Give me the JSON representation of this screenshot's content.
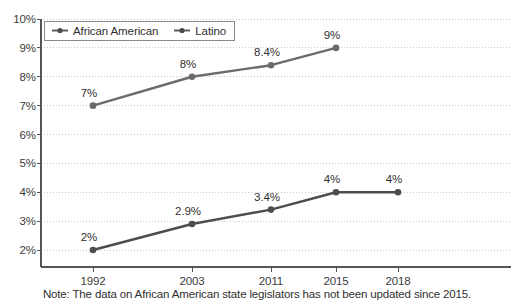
{
  "chart_data": {
    "type": "line",
    "title": "",
    "xlabel": "",
    "ylabel": "",
    "categories": [
      "1992",
      "2003",
      "2011",
      "2015",
      "2018"
    ],
    "ylim": [
      2,
      10
    ],
    "ytick_labels": [
      "2%",
      "3%",
      "4%",
      "5%",
      "6%",
      "7%",
      "8%",
      "9%",
      "10%"
    ],
    "ytick_values": [
      2,
      3,
      4,
      5,
      6,
      7,
      8,
      9,
      10
    ],
    "grid": true,
    "legend_position": "top-left",
    "series": [
      {
        "name": "African American",
        "color": "#6b6b6b",
        "values": [
          7,
          8,
          8.4,
          9,
          null
        ],
        "labels": [
          "7%",
          "8%",
          "8.4%",
          "9%",
          ""
        ]
      },
      {
        "name": "Latino",
        "color": "#4d4d4d",
        "values": [
          2,
          2.9,
          3.4,
          4,
          4
        ],
        "labels": [
          "2%",
          "2.9%",
          "3.4%",
          "4%",
          "4%"
        ]
      }
    ],
    "note": "Note: The data on African American state legislators has not been updated since 2015."
  },
  "legend": {
    "items": [
      {
        "label": "African American",
        "marker": "line-dot-marker"
      },
      {
        "label": "Latino",
        "marker": "line-dot-marker"
      }
    ]
  },
  "colors": {
    "series_african_american": "#6b6b6b",
    "series_latino": "#4d4d4d",
    "axis": "#555555",
    "gridline": "#c9c9c9",
    "text": "#2f2f2f",
    "background": "#ffffff"
  }
}
